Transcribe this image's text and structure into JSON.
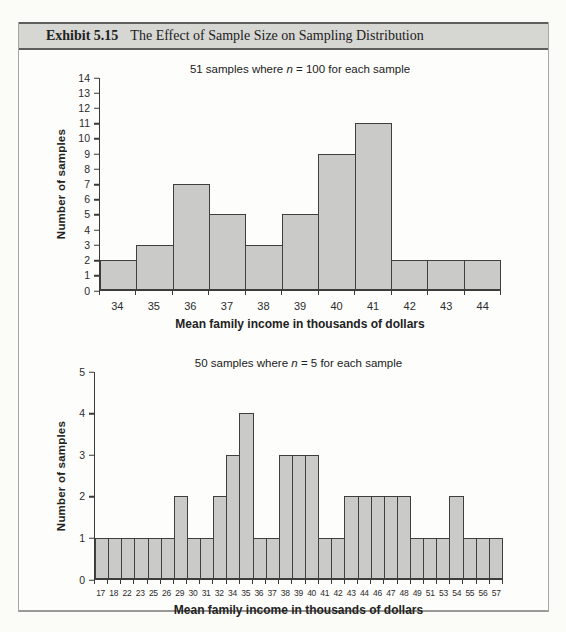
{
  "header": {
    "exhibit_label": "Exhibit 5.15",
    "title": "The Effect of Sample Size on Sampling Distribution"
  },
  "colors": {
    "bar_fill": "#cacac8",
    "bar_border": "#3f3f3f",
    "axis": "#3a3a3a",
    "header_strip": "#d6d6d2"
  },
  "chart_data": [
    {
      "type": "bar",
      "title": "51 samples where n = 100 for each sample",
      "title_prefix": "51 samples where ",
      "title_italic": "n",
      "title_suffix": " = 100 for each sample",
      "ylabel": "Number of samples",
      "xlabel": "Mean family income in thousands of dollars",
      "categories": [
        "34",
        "35",
        "36",
        "37",
        "38",
        "39",
        "40",
        "41",
        "42",
        "43",
        "44"
      ],
      "values": [
        2,
        3,
        7,
        5,
        3,
        5,
        9,
        11,
        2,
        2,
        2
      ],
      "ylim": [
        0,
        14
      ],
      "ytick_step": 1,
      "grid": false,
      "legend": "none"
    },
    {
      "type": "bar",
      "title": "50 samples where n = 5 for each sample",
      "title_prefix": "50 samples where ",
      "title_italic": "n",
      "title_suffix": " = 5 for each sample",
      "ylabel": "Number of samples",
      "xlabel": "Mean family income in thousands of dollars",
      "categories": [
        "17",
        "18",
        "22",
        "23",
        "25",
        "26",
        "29",
        "30",
        "31",
        "32",
        "34",
        "35",
        "36",
        "37",
        "38",
        "39",
        "40",
        "41",
        "42",
        "43",
        "44",
        "46",
        "47",
        "48",
        "49",
        "51",
        "53",
        "54",
        "55",
        "56",
        "57"
      ],
      "values": [
        1,
        1,
        1,
        1,
        1,
        1,
        2,
        1,
        1,
        2,
        3,
        4,
        1,
        1,
        3,
        3,
        3,
        1,
        1,
        2,
        2,
        2,
        2,
        2,
        1,
        1,
        1,
        2,
        1,
        1,
        1
      ],
      "ylim": [
        0,
        5
      ],
      "ytick_step": 1,
      "grid": false,
      "legend": "none"
    }
  ]
}
